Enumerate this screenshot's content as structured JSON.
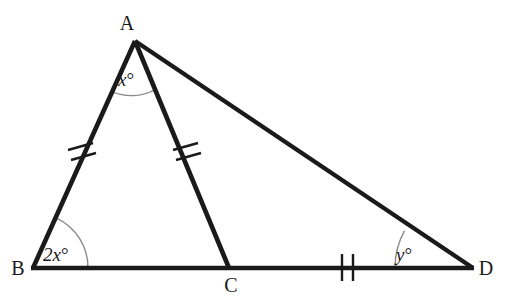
{
  "figure": {
    "type": "euclidean-geometry-diagram",
    "background_color": "#ffffff",
    "stroke_color": "#1a1a1a",
    "arc_color": "#8a8a8a",
    "stroke_width": 4
  },
  "vertices": [
    {
      "id": "A",
      "label": "A",
      "x": 135,
      "y": 41,
      "label_x": 127,
      "label_y": 30
    },
    {
      "id": "B",
      "label": "B",
      "x": 33,
      "y": 268,
      "label_x": 14,
      "label_y": 274
    },
    {
      "id": "C",
      "label": "C",
      "x": 229,
      "y": 268,
      "label_x": 223,
      "label_y": 291
    },
    {
      "id": "D",
      "label": "D",
      "x": 473,
      "y": 268,
      "label_x": 481,
      "label_y": 274
    }
  ],
  "segments": [
    {
      "id": "AB",
      "from": "A",
      "to": "B",
      "ticks": 2,
      "tick_position": 0.49
    },
    {
      "id": "AC",
      "from": "A",
      "to": "C",
      "ticks": 2,
      "tick_position": 0.49
    },
    {
      "id": "AD",
      "from": "A",
      "to": "D",
      "ticks": 0
    },
    {
      "id": "BD",
      "from": "B",
      "to": "D",
      "ticks": 0
    }
  ],
  "tick_marks": [
    {
      "id": "tick-AB",
      "on_segment": "AB",
      "count": 2,
      "x": 78,
      "y": 153
    },
    {
      "id": "tick-AC",
      "on_segment": "AC",
      "count": 2,
      "x": 184,
      "y": 153
    },
    {
      "id": "tick-CD",
      "on_segment": "CD",
      "count": 2,
      "x": 347,
      "y": 267
    }
  ],
  "angles": [
    {
      "id": "angle-A",
      "at_vertex": "A",
      "label": "x",
      "degree_symbol": "°",
      "full_label": "x°",
      "label_x": 118,
      "label_y": 86,
      "arc_radius": 52
    },
    {
      "id": "angle-B",
      "at_vertex": "B",
      "label": "2x",
      "degree_symbol": "°",
      "full_label": "2x°",
      "label_x": 43,
      "label_y": 261,
      "arc_radius": 55
    },
    {
      "id": "angle-D",
      "at_vertex": "D",
      "label": "y",
      "degree_symbol": "°",
      "full_label": "y°",
      "label_x": 396,
      "label_y": 261,
      "arc_radius": 78
    }
  ],
  "labels": {
    "vertex_a": "A",
    "vertex_b": "B",
    "vertex_c": "C",
    "vertex_d": "D",
    "angle_a_var": "x",
    "angle_b_var": "2x",
    "angle_d_var": "y",
    "degree": "°"
  }
}
